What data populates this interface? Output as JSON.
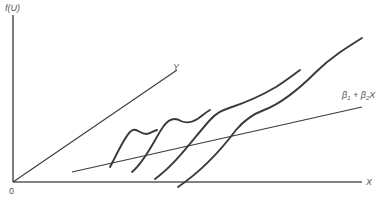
{
  "diagram": {
    "y_axis_label": "f(U)",
    "x_axis_label": "X",
    "origin_label": "0",
    "line_y_label": "Y",
    "regression_label": {
      "beta1": "β",
      "beta1_sub": "1",
      "plus": " + ",
      "beta2": "β",
      "beta2_sub": "2",
      "var": "X"
    },
    "curves_count": 4,
    "colors": {
      "axis": "#5a5a5a",
      "line": "#3a3a3a",
      "label": "#555555",
      "background": "#ffffff"
    }
  }
}
